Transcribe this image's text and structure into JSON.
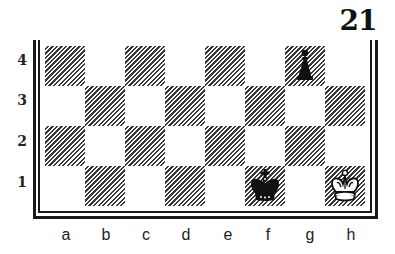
{
  "diagram": {
    "number": "21",
    "files": [
      "a",
      "b",
      "c",
      "d",
      "e",
      "f",
      "g",
      "h"
    ],
    "ranks": [
      "4",
      "3",
      "2",
      "1"
    ],
    "colors": {
      "dark_hatch": "#3a3a3a",
      "light": "#ffffff",
      "border": "#1a1a1a"
    },
    "pieces": [
      {
        "square": "g4",
        "piece": "pawn",
        "color": "black",
        "icon": "black-pawn-icon"
      },
      {
        "square": "f1",
        "piece": "king",
        "color": "black",
        "icon": "black-king-icon"
      },
      {
        "square": "h1",
        "piece": "king",
        "color": "white",
        "icon": "white-king-icon"
      }
    ]
  }
}
